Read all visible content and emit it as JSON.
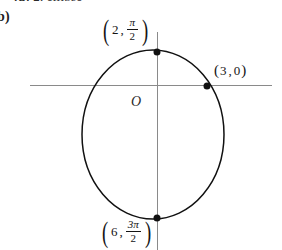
{
  "figure": {
    "cutoff_header": {
      "prefix": "(a)",
      "value": "2,",
      "suffix": "ellipse"
    },
    "part_label": "b)",
    "origin_label": "O",
    "curve_type": "ellipse",
    "axes": {
      "horizontal_name": "polar-axis",
      "vertical_name": "vertical-axis"
    },
    "points": [
      {
        "name": "top-vertex",
        "r": "2",
        "theta_numerator": "π",
        "theta_denominator": "2",
        "has_fraction": true,
        "label_plain": "(2, π/2)"
      },
      {
        "name": "right-vertex",
        "r": "3",
        "theta": "0",
        "has_fraction": false,
        "label_plain": "(3, 0)"
      },
      {
        "name": "bottom-vertex",
        "r": "6",
        "theta_numerator": "3π",
        "theta_denominator": "2",
        "has_fraction": true,
        "label_plain": "(6, 3π/2)"
      }
    ],
    "colors": {
      "curve": "#111111",
      "axis": "#8a8a8a",
      "text": "#141414",
      "dot": "#111111",
      "background": "#ffffff"
    }
  }
}
